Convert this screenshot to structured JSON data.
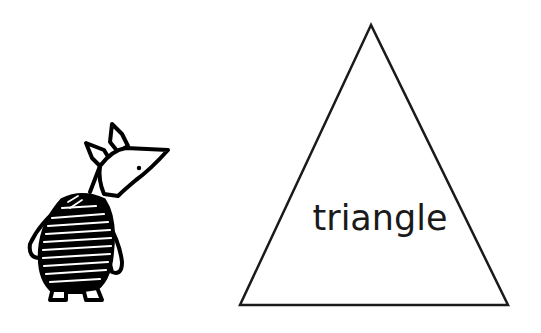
{
  "shape": {
    "name": "triangle",
    "label": "triangle",
    "stroke_color": "#1a1a1a",
    "fill_color": "#ffffff",
    "vertices": [
      [
        371,
        25
      ],
      [
        240,
        305
      ],
      [
        508,
        305
      ]
    ]
  },
  "character": {
    "description": "striped-shirt pig cartoon character, facing right",
    "stroke_color": "#000000"
  },
  "background": "#ffffff"
}
